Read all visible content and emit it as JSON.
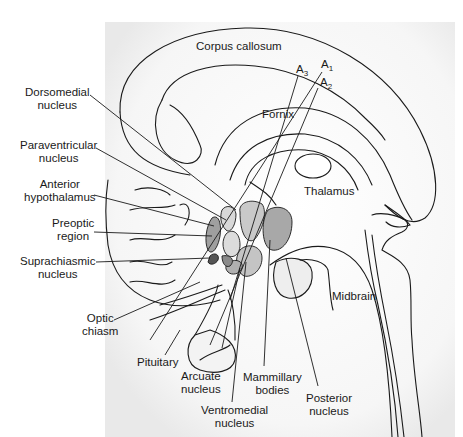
{
  "diagram": {
    "type": "anatomical-illustration",
    "colors": {
      "outline": "#1a1a1a",
      "shading_light": "#e6e6e6",
      "shading_mid": "#bdbdbd",
      "shading_dark": "#8c8c8c",
      "background": "#ffffff"
    },
    "structures": {
      "corpus_callosum": "Corpus callosum",
      "fornix": "Fornix",
      "thalamus": "Thalamus",
      "midbrain": "Midbrain"
    },
    "electrode_tracks": {
      "a1": {
        "base": "A",
        "sub": "1"
      },
      "a2": {
        "base": "A",
        "sub": "2"
      },
      "a3": {
        "base": "A",
        "sub": "3"
      }
    },
    "left_labels": {
      "dorsomedial": [
        "Dorsomedial",
        "nucleus"
      ],
      "paraventricular": [
        "Paraventricular",
        "nucleus"
      ],
      "anterior_hypothalamus": [
        "Anterior",
        "hypothalamus"
      ],
      "preoptic": [
        "Preoptic",
        "region"
      ],
      "suprachiasmic": [
        "Suprachiasmic",
        "nucleus"
      ],
      "optic_chiasm": [
        "Optic",
        "chiasm"
      ]
    },
    "bottom_labels": {
      "pituitary": [
        "Pituitary"
      ],
      "arcuate": [
        "Arcuate",
        "nucleus"
      ],
      "ventromedial": [
        "Ventromedial",
        "nucleus"
      ],
      "mammillary": [
        "Mammillary",
        "bodies"
      ],
      "posterior": [
        "Posterior",
        "nucleus"
      ]
    }
  }
}
